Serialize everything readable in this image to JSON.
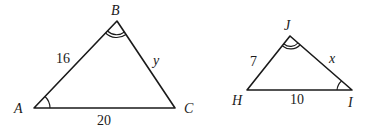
{
  "diagram": {
    "type": "similar-triangles",
    "triangles": [
      {
        "name": "ABC",
        "vertices": {
          "A": "A",
          "B": "B",
          "C": "C"
        },
        "sides": {
          "AB": "16",
          "BC": "y",
          "AC": "20"
        },
        "angle_marks": {
          "A": "single-arc",
          "B": "double-arc"
        }
      },
      {
        "name": "HJI",
        "vertices": {
          "H": "H",
          "J": "J",
          "I": "I"
        },
        "sides": {
          "HJ": "7",
          "JI": "x",
          "HI": "10"
        },
        "angle_marks": {
          "J": "double-arc",
          "I": "single-arc"
        }
      }
    ],
    "colors": {
      "stroke": "#1a1a1a",
      "background": "#ffffff"
    }
  }
}
